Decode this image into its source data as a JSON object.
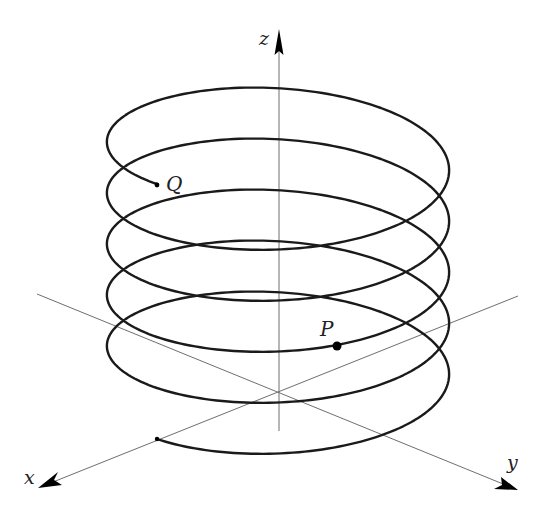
{
  "figure": {
    "axes": {
      "x": {
        "label": "x"
      },
      "y": {
        "label": "y"
      },
      "z": {
        "label": "z"
      }
    },
    "points": {
      "P": {
        "label": "P"
      },
      "Q": {
        "label": "Q"
      }
    },
    "helix": {
      "turns": 5,
      "start_on": "x-axis",
      "colors": {
        "curve": "#1a1a1a",
        "axes": "#6e6e6e"
      }
    }
  }
}
